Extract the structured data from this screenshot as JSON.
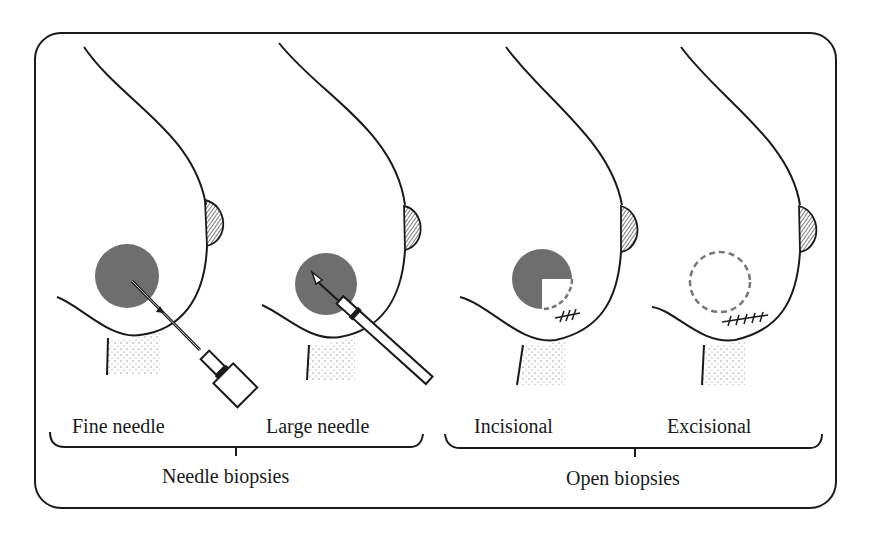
{
  "figure": {
    "colors": {
      "ink": "#1a1a1a",
      "mass_fill": "#6e6e6e",
      "dashed_outline": "#777777",
      "background": "#ffffff"
    },
    "panels": [
      {
        "id": "fine-needle",
        "label": "Fine needle",
        "group": "needle"
      },
      {
        "id": "large-needle",
        "label": "Large needle",
        "group": "needle"
      },
      {
        "id": "incisional",
        "label": "Incisional",
        "group": "open"
      },
      {
        "id": "excisional",
        "label": "Excisional",
        "group": "open"
      }
    ],
    "groups": {
      "needle": {
        "label": "Needle biopsies"
      },
      "open": {
        "label": "Open biopsies"
      }
    }
  }
}
